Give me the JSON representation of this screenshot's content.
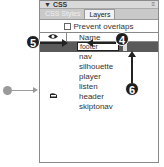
{
  "panel": {
    "title": "CSS",
    "collapse_icon": "▼",
    "menu_icon": "≡",
    "tabs": [
      {
        "label": "CSS Styles",
        "active": false
      },
      {
        "label": "Layers",
        "active": true
      }
    ],
    "prevent_overlaps_label": "Prevent overlaps",
    "prevent_overlaps_checked": false,
    "columns": {
      "visibility": "eye-icon",
      "name": "Name",
      "z": "Z"
    },
    "rows": [
      {
        "name": "footer",
        "z": "",
        "selected": true,
        "editing": true
      },
      {
        "name": "nav",
        "z": ""
      },
      {
        "name": "silhouette",
        "z": ""
      },
      {
        "name": "player",
        "z": ""
      },
      {
        "name": "listen",
        "z": ""
      },
      {
        "name": "header",
        "z": "",
        "vis_icon": "closed-eye-icon"
      },
      {
        "name": "skiptonav",
        "z": ""
      }
    ]
  },
  "callouts": {
    "four": "4",
    "five": "5",
    "six": "6"
  }
}
